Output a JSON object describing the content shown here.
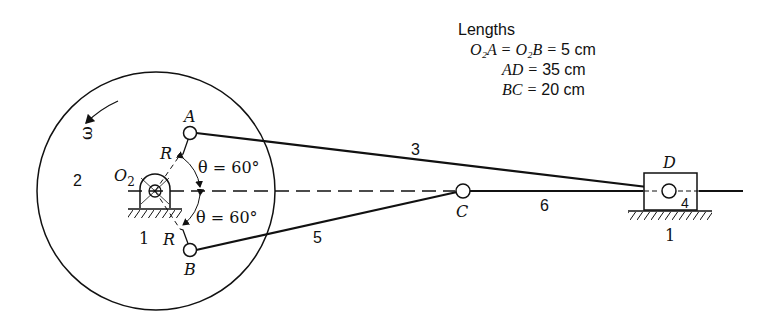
{
  "legend": {
    "title": "Lengths",
    "rows": [
      {
        "lhs": "O₂A = O₂B = ",
        "value": "5",
        "unit": " cm"
      },
      {
        "lhs": "AD = ",
        "value": "35",
        "unit": " cm"
      },
      {
        "lhs": "BC = ",
        "value": "20",
        "unit": " cm"
      }
    ]
  },
  "labels": {
    "omega": "ω",
    "link2": "2",
    "ground_left": "1",
    "ground_right": "1",
    "o2": "O",
    "o2_sub": "2",
    "point_a": "A",
    "point_b": "B",
    "point_c": "C",
    "point_d": "D",
    "r_top": "R",
    "r_bottom": "R",
    "theta_top": "θ = 60°",
    "theta_bottom": "θ = 60°",
    "link3": "3",
    "link4": "4",
    "link5": "5",
    "link6": "6"
  },
  "colors": {
    "ink": "#111111",
    "background": "#ffffff"
  }
}
